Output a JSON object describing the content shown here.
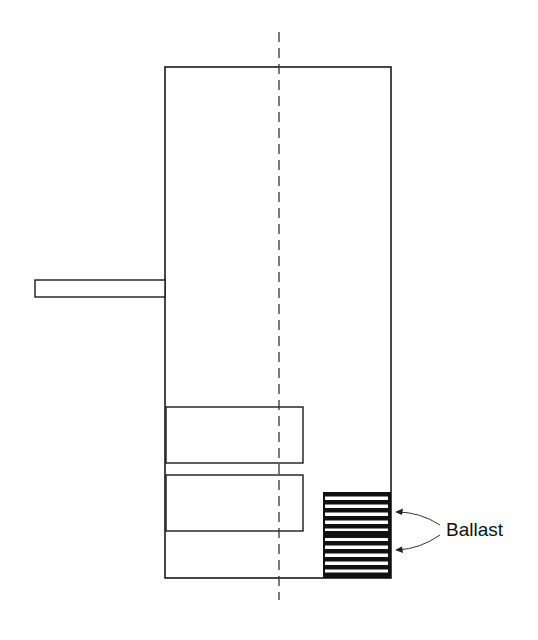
{
  "diagram": {
    "labels": {
      "ballast": "Ballast"
    },
    "colors": {
      "stroke": "#1a1a1a",
      "background": "#ffffff"
    }
  }
}
